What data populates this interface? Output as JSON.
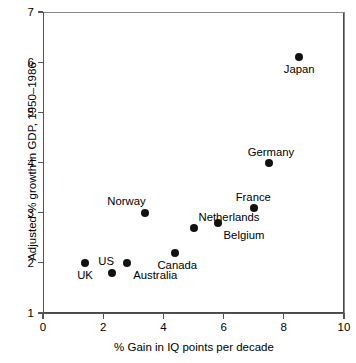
{
  "chart_data": {
    "type": "scatter",
    "title": "",
    "xlabel": "% Gain in IQ points per decade",
    "ylabel": "Adjusted % growth in GDP, 1950–1986",
    "xlim": [
      0,
      10
    ],
    "ylim": [
      1,
      7
    ],
    "xticks": [
      "0",
      "2",
      "4",
      "6",
      "8",
      "10"
    ],
    "xtick_values": [
      0,
      2,
      4,
      6,
      8,
      10
    ],
    "yticks": [
      "1",
      "2",
      "3",
      "4",
      "5",
      "6",
      "7"
    ],
    "ytick_values": [
      1,
      2,
      3,
      4,
      5,
      6,
      7
    ],
    "grid": false,
    "legend": "none",
    "marker_color": "#111111",
    "points": [
      {
        "label": "UK",
        "x": 1.4,
        "y": 2.0,
        "label_pos": "below-left"
      },
      {
        "label": "US",
        "x": 2.3,
        "y": 1.8,
        "label_pos": "above-left"
      },
      {
        "label": "Australia",
        "x": 2.8,
        "y": 2.0,
        "label_pos": "below-right"
      },
      {
        "label": "Norway",
        "x": 3.4,
        "y": 3.0,
        "label_pos": "above-left"
      },
      {
        "label": "Canada",
        "x": 4.4,
        "y": 2.2,
        "label_pos": "below"
      },
      {
        "label": "Netherlands",
        "x": 5.0,
        "y": 2.7,
        "label_pos": "above-right"
      },
      {
        "label": "Belgium",
        "x": 5.8,
        "y": 2.8,
        "label_pos": "below-right"
      },
      {
        "label": "France",
        "x": 7.0,
        "y": 3.1,
        "label_pos": "above"
      },
      {
        "label": "Germany",
        "x": 7.5,
        "y": 4.0,
        "label_pos": "above"
      },
      {
        "label": "Japan",
        "x": 8.5,
        "y": 6.1,
        "label_pos": "below"
      }
    ]
  },
  "labels": {
    "x_title": "% Gain in IQ points per decade",
    "y_title": "Adjusted % growth in GDP, 1950–1986"
  }
}
